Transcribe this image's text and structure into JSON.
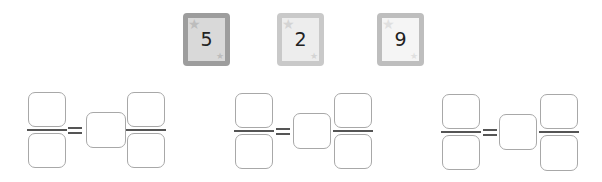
{
  "cards": [
    {
      "value": "5",
      "shade": "dark"
    },
    {
      "value": "2",
      "shade": "light"
    },
    {
      "value": "9",
      "shade": "lighter"
    }
  ],
  "equations": [
    {
      "left_numerator": "",
      "left_denominator": "",
      "middle": "",
      "right_numerator": "",
      "right_denominator": "",
      "operator": "="
    },
    {
      "left_numerator": "",
      "left_denominator": "",
      "middle": "",
      "right_numerator": "",
      "right_denominator": "",
      "operator": "="
    },
    {
      "left_numerator": "",
      "left_denominator": "",
      "middle": "",
      "right_numerator": "",
      "right_denominator": "",
      "operator": "="
    }
  ],
  "colors": {
    "box_border": "#a8a8a8",
    "fraction_bar": "#555555",
    "card1_border": "#9d9d9d",
    "card2_border": "#c9c9c9",
    "card3_border": "#bebebe"
  }
}
